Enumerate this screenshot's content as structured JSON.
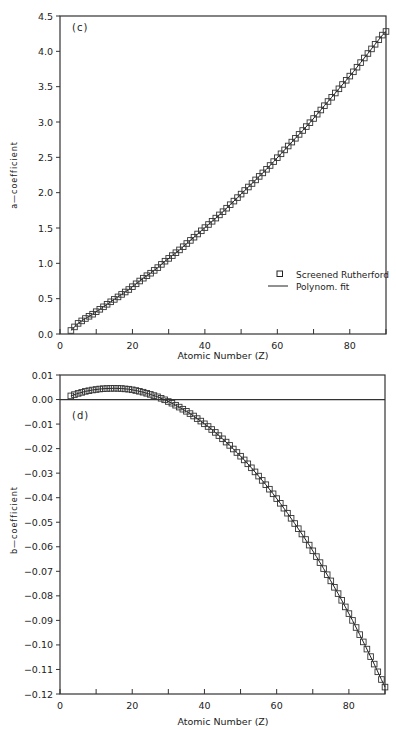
{
  "chart_data": [
    {
      "type": "scatter",
      "panel_label": "(c)",
      "title": "",
      "xlabel": "Atomic Number (Z)",
      "ylabel": "a—coefficient",
      "xlim": [
        0,
        90
      ],
      "ylim": [
        0.0,
        4.5
      ],
      "xticks": [
        0,
        20,
        40,
        60,
        80
      ],
      "xticks_minor": [
        10,
        30,
        50,
        70,
        90
      ],
      "yticks": [
        0.0,
        0.5,
        1.0,
        1.5,
        2.0,
        2.5,
        3.0,
        3.5,
        4.0,
        4.5
      ],
      "ytick_labels": [
        "0.0",
        "0.5",
        "1.0",
        "1.5",
        "2.0",
        "2.5",
        "3.0",
        "3.5",
        "4.0",
        "4.5"
      ],
      "grid": false,
      "legend_position": "lower right",
      "legend": [
        {
          "label": "Screened Rutherford",
          "marker": "open-square"
        },
        {
          "label": "Polynom. fit",
          "marker": "line"
        }
      ],
      "series": [
        {
          "name": "Screened Rutherford",
          "style": "open-square",
          "x": [
            3,
            5,
            7,
            9,
            11,
            13,
            15,
            17,
            19,
            21,
            23,
            25,
            27,
            29,
            31,
            33,
            35,
            37,
            39,
            41,
            43,
            45,
            47,
            49,
            51,
            53,
            55,
            57,
            59,
            61,
            63,
            65,
            67,
            69,
            71,
            73,
            75,
            77,
            79,
            81,
            83,
            85,
            87,
            89,
            90
          ],
          "values": [
            0.05,
            0.15,
            0.22,
            0.28,
            0.35,
            0.42,
            0.49,
            0.56,
            0.63,
            0.71,
            0.79,
            0.86,
            0.94,
            1.03,
            1.11,
            1.19,
            1.28,
            1.37,
            1.46,
            1.55,
            1.64,
            1.73,
            1.83,
            1.93,
            2.03,
            2.13,
            2.23,
            2.33,
            2.44,
            2.55,
            2.66,
            2.77,
            2.88,
            2.99,
            3.11,
            3.23,
            3.35,
            3.47,
            3.59,
            3.71,
            3.84,
            3.97,
            4.1,
            4.23,
            4.28
          ]
        },
        {
          "name": "Polynom. fit",
          "style": "line",
          "x": [
            3,
            10,
            20,
            30,
            40,
            50,
            60,
            70,
            80,
            90
          ],
          "values": [
            0.05,
            0.31,
            0.67,
            1.07,
            1.5,
            1.98,
            2.49,
            3.05,
            3.64,
            4.28
          ]
        }
      ]
    },
    {
      "type": "scatter",
      "panel_label": "(d)",
      "title": "",
      "xlabel": "Atomic Number (Z)",
      "ylabel": "b—coefficient",
      "xlim": [
        0,
        90
      ],
      "ylim": [
        -0.12,
        0.01
      ],
      "xticks": [
        0,
        20,
        40,
        60,
        80
      ],
      "xticks_minor": [
        10,
        30,
        50,
        70,
        90
      ],
      "yticks": [
        0.01,
        0.0,
        -0.01,
        -0.02,
        -0.03,
        -0.04,
        -0.05,
        -0.06,
        -0.07,
        -0.08,
        -0.09,
        -0.1,
        -0.11,
        -0.12
      ],
      "ytick_labels": [
        "0.01",
        "0.00",
        "−0.01",
        "−0.02",
        "−0.03",
        "−0.04",
        "−0.05",
        "−0.06",
        "−0.07",
        "−0.08",
        "−0.09",
        "−0.10",
        "−0.11",
        "−0.12"
      ],
      "grid": false,
      "reference_line_y": 0.0,
      "series": [
        {
          "name": "Screened Rutherford",
          "style": "open-square",
          "x": [
            3,
            5,
            7,
            9,
            11,
            13,
            15,
            17,
            19,
            21,
            23,
            25,
            27,
            29,
            31,
            33,
            35,
            37,
            39,
            41,
            43,
            45,
            47,
            49,
            51,
            53,
            55,
            57,
            59,
            61,
            63,
            65,
            67,
            69,
            71,
            73,
            75,
            77,
            79,
            81,
            83,
            85,
            87,
            89,
            90
          ],
          "values": [
            0.0015,
            0.0025,
            0.0033,
            0.0039,
            0.0043,
            0.0045,
            0.0046,
            0.0045,
            0.0042,
            0.0037,
            0.003,
            0.0021,
            0.0011,
            -0.0001,
            -0.0015,
            -0.0031,
            -0.0048,
            -0.0067,
            -0.0088,
            -0.011,
            -0.0134,
            -0.016,
            -0.0187,
            -0.0216,
            -0.0246,
            -0.0278,
            -0.0312,
            -0.0347,
            -0.0384,
            -0.0423,
            -0.0463,
            -0.0505,
            -0.0548,
            -0.0593,
            -0.064,
            -0.0689,
            -0.0739,
            -0.0791,
            -0.0845,
            -0.09,
            -0.0958,
            -0.1017,
            -0.1078,
            -0.1141,
            -0.1172
          ]
        },
        {
          "name": "Polynom. fit",
          "style": "line",
          "x": [
            3,
            10,
            20,
            30,
            40,
            50,
            60,
            70,
            80,
            90
          ],
          "values": [
            0.0015,
            0.0041,
            0.004,
            -0.0008,
            -0.0099,
            -0.0231,
            -0.0403,
            -0.0616,
            -0.0872,
            -0.1172
          ]
        }
      ]
    }
  ]
}
